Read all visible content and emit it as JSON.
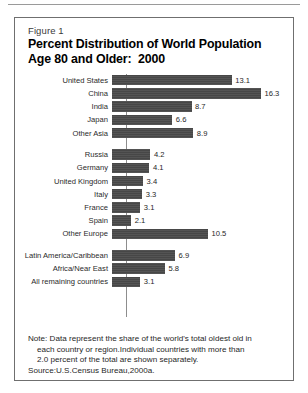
{
  "figure": {
    "label": "Figure 1",
    "title_line1": "Percent Distribution of World Population",
    "title_line2": "Age 80 and Older:  2000"
  },
  "note": {
    "line1": "Note: Data represent the share of the world's total oldest old in",
    "line2": "each country or region.Individual countries with more than",
    "line3": "2.0 percent of the total are shown separately.",
    "line4": "Source:U.S.Census Bureau,2000a."
  },
  "chart_data": {
    "type": "bar",
    "orientation": "horizontal",
    "title": "Percent Distribution of World Population Age 80 and Older:  2000",
    "xlabel": "",
    "ylabel": "",
    "xlim": [
      0,
      16.3
    ],
    "grid": false,
    "legend": null,
    "bar_color": "#474747",
    "groups": [
      {
        "name": "Americas and Asia",
        "categories": [
          "United States",
          "China",
          "India",
          "Japan",
          "Other Asia"
        ],
        "values": [
          13.1,
          16.3,
          8.7,
          6.6,
          8.9
        ]
      },
      {
        "name": "Europe",
        "categories": [
          "Russia",
          "Germany",
          "United Kingdom",
          "Italy",
          "France",
          "Spain",
          "Other Europe"
        ],
        "values": [
          4.2,
          4.1,
          3.4,
          3.3,
          3.1,
          2.1,
          10.5
        ]
      },
      {
        "name": "Other regions",
        "categories": [
          "Latin America/Caribbean",
          "Africa/Near East",
          "All remaining countries"
        ],
        "values": [
          6.9,
          5.8,
          3.1
        ]
      }
    ],
    "categories": [
      "United States",
      "China",
      "India",
      "Japan",
      "Other Asia",
      "Russia",
      "Germany",
      "United Kingdom",
      "Italy",
      "France",
      "Spain",
      "Other Europe",
      "Latin America/Caribbean",
      "Africa/Near East",
      "All remaining countries"
    ],
    "values": [
      13.1,
      16.3,
      8.7,
      6.6,
      8.9,
      4.2,
      4.1,
      3.4,
      3.3,
      3.1,
      2.1,
      10.5,
      6.9,
      5.8,
      3.1
    ]
  }
}
